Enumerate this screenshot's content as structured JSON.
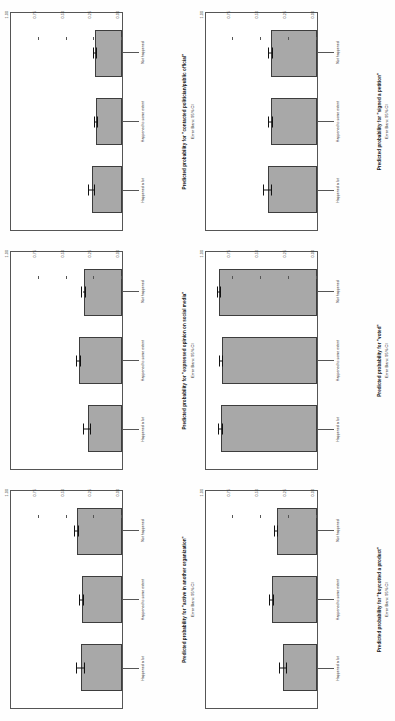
{
  "figure": {
    "categories": [
      "Happened a lot",
      "Happened to some extent",
      "Not happened"
    ],
    "y_ticks": [
      "0.00",
      "0.25",
      "0.50",
      "0.75",
      "1.00"
    ],
    "y_min": 0,
    "y_max": 1,
    "error_caption": "Error Bars: 95% CI",
    "bar_color": "#a8a8a8",
    "bar_edge_color": "#3d3d3d"
  },
  "chart_data": [
    {
      "type": "bar",
      "title": "Predicted probability for \"active in another organization\"",
      "xlabel": "",
      "ylabel": "Predicted probability for \"active in another organization\"",
      "categories": [
        "Happened a lot",
        "Happened to some extent",
        "Not happened"
      ],
      "values": [
        0.37,
        0.36,
        0.41
      ],
      "errors": [
        0.035,
        0.018,
        0.018
      ],
      "ylim": [
        0,
        1
      ],
      "yticks": [
        "0.00",
        "0.25",
        "0.50",
        "0.75",
        "1.00"
      ],
      "annotation": "Error Bars: 95% CI",
      "grid": false,
      "legend": "none"
    },
    {
      "type": "bar",
      "title": "Predicted probability for \"expressed opinion on social media\"",
      "xlabel": "",
      "ylabel": "Predicted probability for \"expressed opinion on social media\"",
      "categories": [
        "Happened a lot",
        "Happened to some extent",
        "Not happened"
      ],
      "values": [
        0.31,
        0.39,
        0.34
      ],
      "errors": [
        0.035,
        0.018,
        0.016
      ],
      "ylim": [
        0,
        1
      ],
      "yticks": [
        "0.00",
        "0.25",
        "0.50",
        "0.75",
        "1.00"
      ],
      "annotation": "Error Bars: 95% CI",
      "grid": false,
      "legend": "none"
    },
    {
      "type": "bar",
      "title": "Predicted probability for \"contacted politician/public official\"",
      "xlabel": "",
      "ylabel": "Predicted probability for \"contacted politician/public official\"",
      "categories": [
        "Happened a lot",
        "Happened to some extent",
        "Not happened"
      ],
      "values": [
        0.27,
        0.23,
        0.24
      ],
      "errors": [
        0.03,
        0.015,
        0.014
      ],
      "ylim": [
        0,
        1
      ],
      "yticks": [
        "0.00",
        "0.25",
        "0.50",
        "0.75",
        "1.00"
      ],
      "annotation": "Error Bars: 95% CI",
      "grid": false,
      "legend": "none"
    },
    {
      "type": "bar",
      "title": "Predicted probability for \"boycotted a product\"",
      "xlabel": "",
      "ylabel": "Predicted probability for \"boycotted a product\"",
      "categories": [
        "Happened a lot",
        "Happened to some extent",
        "Not happened"
      ],
      "values": [
        0.3,
        0.4,
        0.36
      ],
      "errors": [
        0.033,
        0.018,
        0.016
      ],
      "ylim": [
        0,
        1
      ],
      "yticks": [
        "0.00",
        "0.25",
        "0.50",
        "0.75",
        "1.00"
      ],
      "annotation": "Error Bars: 95% CI",
      "grid": false,
      "legend": "none"
    },
    {
      "type": "bar",
      "title": "Predicted probability for \"voted\"",
      "xlabel": "",
      "ylabel": "Predicted probability for \"voted\"",
      "categories": [
        "Happened a lot",
        "Happened to some extent",
        "Not happened"
      ],
      "values": [
        0.86,
        0.855,
        0.875
      ],
      "errors": [
        0.022,
        0.012,
        0.011
      ],
      "ylim": [
        0,
        1
      ],
      "yticks": [
        "0.00",
        "0.25",
        "0.50",
        "0.75",
        "1.00"
      ],
      "annotation": "Error Bars: 95% CI",
      "grid": false,
      "legend": "none"
    },
    {
      "type": "bar",
      "title": "Predicted probability for \"signed a petition\"",
      "xlabel": "",
      "ylabel": "Predicted probability for \"signed a petition\"",
      "categories": [
        "Happened a lot",
        "Happened to some extent",
        "Not happened"
      ],
      "values": [
        0.44,
        0.41,
        0.41
      ],
      "errors": [
        0.035,
        0.018,
        0.016
      ],
      "ylim": [
        0,
        1
      ],
      "yticks": [
        "0.00",
        "0.25",
        "0.50",
        "0.75",
        "1.00"
      ],
      "annotation": "Error Bars: 95% CI",
      "grid": false,
      "legend": "none"
    }
  ]
}
